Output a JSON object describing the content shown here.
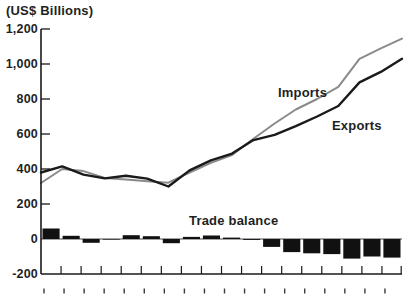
{
  "chart": {
    "kind": "combo line + bar trade chart",
    "background": "#ffffff",
    "axis_color": "#1a1a1a"
  },
  "chart_data": {
    "type": "line+bar",
    "title": "",
    "y_axis": {
      "label": "(US$ Billions)",
      "min": -200,
      "max": 1200,
      "tick_step": 200,
      "tick_labels": [
        "1,200",
        "1,000",
        "800",
        "600",
        "400",
        "200",
        "0",
        "-200"
      ]
    },
    "x_axis": {
      "tick_count": 18,
      "labels_cut_off": true
    },
    "grid": false,
    "legend_position": "inline-annotations",
    "series": [
      {
        "name": "Imports",
        "type": "line",
        "color": "#8a8a8a",
        "values": [
          320,
          400,
          388,
          349,
          340,
          330,
          322,
          380,
          435,
          480,
          573,
          660,
          740,
          800,
          870,
          1030,
          1090,
          1145
        ]
      },
      {
        "name": "Exports",
        "type": "line",
        "color": "#1a1a1a",
        "values": [
          380,
          415,
          368,
          346,
          362,
          345,
          300,
          392,
          450,
          488,
          565,
          595,
          645,
          700,
          760,
          895,
          955,
          1030
        ]
      },
      {
        "name": "Trade balance",
        "type": "bar",
        "color": "#111111",
        "values": [
          60,
          18,
          -22,
          -3,
          22,
          16,
          -24,
          12,
          20,
          8,
          -5,
          -45,
          -75,
          -82,
          -86,
          -112,
          -100,
          -106
        ]
      }
    ]
  }
}
